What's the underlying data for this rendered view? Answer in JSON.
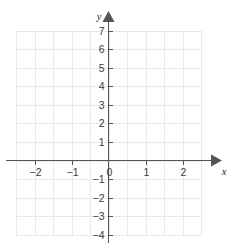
{
  "figure": {
    "title": "",
    "axis_name_x": "x",
    "axis_name_y": "y",
    "origin_label": "0"
  },
  "colors": {
    "grid": "#e9e9e9",
    "axis": "#555555",
    "label": "#3a3a3a",
    "background": "#ffffff"
  },
  "chart_data": {
    "type": "line",
    "title": "",
    "xlabel": "x",
    "ylabel": "y",
    "xlim": [
      -2.6,
      2.6
    ],
    "ylim": [
      -4,
      7
    ],
    "grid": true,
    "legend": null,
    "series": [],
    "x_ticks": [
      -2,
      -1,
      0,
      1,
      2
    ],
    "x_tick_labels": [
      "−2",
      "−1",
      "0",
      "1",
      "2"
    ],
    "y_ticks": [
      7,
      6,
      5,
      4,
      3,
      2,
      1,
      -1,
      -2,
      -3,
      -4
    ],
    "y_tick_labels": [
      "7",
      "6",
      "5",
      "4",
      "3",
      "2",
      "1",
      "−1",
      "−2",
      "−3",
      "−4"
    ],
    "x_gridlines": [
      -2.5,
      -2,
      -1.5,
      -1,
      -0.5,
      0,
      0.5,
      1,
      1.5,
      2,
      2.5
    ],
    "y_gridlines": [
      7,
      6,
      5,
      4,
      3,
      2,
      1,
      0,
      -1,
      -2,
      -3,
      -4
    ],
    "annotations": []
  }
}
